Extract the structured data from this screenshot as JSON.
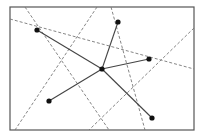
{
  "diagram": {
    "frame": {
      "x": 10,
      "y": 7,
      "w": 184,
      "h": 123,
      "stroke": "#555555"
    },
    "center_node": {
      "x": 102,
      "y": 69
    },
    "outer_nodes": [
      {
        "x": 37,
        "y": 30
      },
      {
        "x": 118,
        "y": 22
      },
      {
        "x": 149,
        "y": 59
      },
      {
        "x": 152,
        "y": 118
      },
      {
        "x": 49,
        "y": 101
      }
    ],
    "dashed_lines": [
      {
        "x1": 25,
        "y1": 7,
        "x2": 109,
        "y2": 130
      },
      {
        "x1": 97,
        "y1": 7,
        "x2": 15,
        "y2": 130
      },
      {
        "x1": 111,
        "y1": 7,
        "x2": 145,
        "y2": 130
      },
      {
        "x1": 10,
        "y1": 19,
        "x2": 194,
        "y2": 69
      },
      {
        "x1": 194,
        "y1": 28,
        "x2": 89,
        "y2": 130
      }
    ],
    "colors": {
      "node": "#111111",
      "edge": "#444444",
      "dashed": "#777777"
    }
  }
}
